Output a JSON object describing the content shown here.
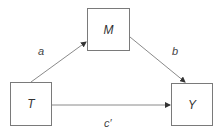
{
  "diagram": {
    "type": "mediation-path-diagram",
    "nodes": [
      {
        "id": "T",
        "label": "T"
      },
      {
        "id": "M",
        "label": "M"
      },
      {
        "id": "Y",
        "label": "Y"
      }
    ],
    "edges": [
      {
        "from": "T",
        "to": "M",
        "label": "a"
      },
      {
        "from": "M",
        "to": "Y",
        "label": "b"
      },
      {
        "from": "T",
        "to": "Y",
        "label": "c′"
      }
    ],
    "colors": {
      "line": "#8a8a8a",
      "border": "#7a7a7a",
      "text": "#333333"
    }
  }
}
